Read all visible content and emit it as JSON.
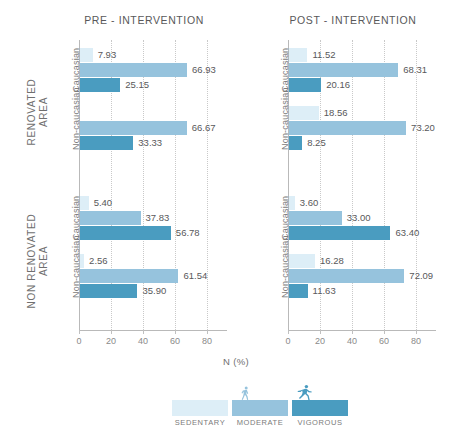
{
  "panels": [
    {
      "key": "pre",
      "title": "PRE - INTERVENTION"
    },
    {
      "key": "post",
      "title": "POST - INTERVENTION"
    }
  ],
  "areas": [
    {
      "line1": "RENOVATED",
      "line2": "AREA"
    },
    {
      "line1": "NON RENOVATED",
      "line2": "AREA"
    }
  ],
  "ethnicities": [
    "Caucasian",
    "Non-caucasian"
  ],
  "axis": {
    "caption": "N (%)",
    "ticks": [
      "0",
      "20",
      "40",
      "60",
      "80"
    ],
    "tick_values": [
      0,
      20,
      40,
      60,
      80
    ],
    "min": 0,
    "max": 90
  },
  "legend": {
    "items": [
      {
        "label": "SEDENTARY",
        "color": "#ddeef7",
        "icon": "none"
      },
      {
        "label": "MODERATE",
        "color": "#96c3dd",
        "icon": "walking-person-icon"
      },
      {
        "label": "VIGOROUS",
        "color": "#4a9cc0",
        "icon": "running-person-icon"
      }
    ]
  },
  "colors": {
    "sedentary": "#ddeef7",
    "moderate": "#96c3dd",
    "vigorous": "#4a9cc0",
    "axis": "#b9b9b9",
    "grid": "#c9c9c9",
    "text": "#58585a"
  },
  "series_names": [
    "Sedentary",
    "Moderate",
    "Vigorous"
  ],
  "chart_data": {
    "type": "bar",
    "orientation": "horizontal",
    "title": "",
    "xlabel": "N (%)",
    "ylabel": "",
    "xlim": [
      0,
      90
    ],
    "xticks": [
      0,
      20,
      40,
      60,
      80
    ],
    "grid": true,
    "legend_position": "bottom",
    "series": [
      {
        "name": "Sedentary",
        "color": "#ddeef7"
      },
      {
        "name": "Moderate",
        "color": "#96c3dd"
      },
      {
        "name": "Vigorous",
        "color": "#4a9cc0"
      }
    ],
    "groups": [
      {
        "panel": "PRE - INTERVENTION",
        "area": "RENOVATED AREA",
        "rows": [
          {
            "category": "Caucasian",
            "values": [
              7.93,
              66.93,
              25.15
            ],
            "labels": [
              "7.93",
              "66.93",
              "25.15"
            ]
          },
          {
            "category": "Non-caucasian",
            "values": [
              0.0,
              66.67,
              33.33
            ],
            "labels": [
              "",
              "66.67",
              "33.33"
            ]
          }
        ]
      },
      {
        "panel": "PRE - INTERVENTION",
        "area": "NON RENOVATED AREA",
        "rows": [
          {
            "category": "Caucasian",
            "values": [
              5.4,
              37.83,
              56.78
            ],
            "labels": [
              "5.40",
              "37.83",
              "56.78"
            ]
          },
          {
            "category": "Non-caucasian",
            "values": [
              2.56,
              61.54,
              35.9
            ],
            "labels": [
              "2.56",
              "61.54",
              "35.90"
            ]
          }
        ]
      },
      {
        "panel": "POST - INTERVENTION",
        "area": "RENOVATED AREA",
        "rows": [
          {
            "category": "Caucasian",
            "values": [
              11.52,
              68.31,
              20.16
            ],
            "labels": [
              "11.52",
              "68.31",
              "20.16"
            ]
          },
          {
            "category": "Non-caucasian",
            "values": [
              18.56,
              73.2,
              8.25
            ],
            "labels": [
              "18.56",
              "73.20",
              "8.25"
            ]
          }
        ]
      },
      {
        "panel": "POST - INTERVENTION",
        "area": "NON RENOVATED AREA",
        "rows": [
          {
            "category": "Caucasian",
            "values": [
              3.6,
              33.0,
              63.4
            ],
            "labels": [
              "3.60",
              "33.00",
              "63.40"
            ]
          },
          {
            "category": "Non-caucasian",
            "values": [
              16.28,
              72.09,
              11.63
            ],
            "labels": [
              "16.28",
              "72.09",
              "11.63"
            ]
          }
        ]
      }
    ]
  }
}
